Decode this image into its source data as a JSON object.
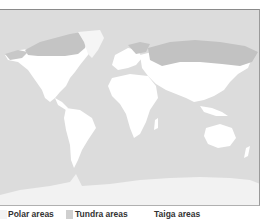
{
  "map": {
    "title": "",
    "colors": {
      "ocean": "#dcdcdc",
      "land": "#ffffff",
      "polar": "#f3f3f3",
      "tundra": "#c4c4c4",
      "taiga": "#bdbdbd"
    }
  },
  "legend": {
    "items": [
      {
        "label": "Polar areas",
        "color": "#f3f3f3"
      },
      {
        "label": "Tundra areas",
        "color": "#cfcfcf"
      },
      {
        "label": "Taiga areas",
        "color": "#ffffff"
      }
    ]
  }
}
